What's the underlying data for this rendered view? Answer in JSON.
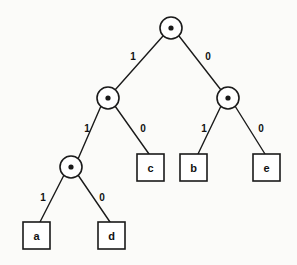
{
  "diagram": {
    "type": "binary-tree",
    "colors": {
      "stroke": "#1a1a1a",
      "background": "#fbfbf9",
      "text": "#111111"
    },
    "internal_nodes": [
      {
        "id": "root",
        "symbol": "•",
        "cx": 171,
        "cy": 28,
        "r": 11,
        "dot_r": 2.6
      },
      {
        "id": "n-l",
        "symbol": "•",
        "cx": 108,
        "cy": 98,
        "r": 11,
        "dot_r": 2.6
      },
      {
        "id": "n-r",
        "symbol": "•",
        "cx": 228,
        "cy": 98,
        "r": 11,
        "dot_r": 2.6
      },
      {
        "id": "n-ll",
        "symbol": "•",
        "cx": 71,
        "cy": 167,
        "r": 11,
        "dot_r": 2.6
      }
    ],
    "leaves": [
      {
        "id": "leaf-c",
        "label": "c",
        "x": 137,
        "y": 154,
        "w": 27,
        "h": 27
      },
      {
        "id": "leaf-b",
        "label": "b",
        "x": 180,
        "y": 154,
        "w": 27,
        "h": 27
      },
      {
        "id": "leaf-e",
        "label": "e",
        "x": 253,
        "y": 154,
        "w": 27,
        "h": 27
      },
      {
        "id": "leaf-a",
        "label": "a",
        "x": 23,
        "y": 222,
        "w": 27,
        "h": 27
      },
      {
        "id": "leaf-d",
        "label": "d",
        "x": 98,
        "y": 222,
        "w": 27,
        "h": 27
      }
    ],
    "edges": [
      {
        "id": "root-to-left",
        "from": "root",
        "to": "n-l",
        "label": "1",
        "x1": 163,
        "y1": 36,
        "x2": 115,
        "y2": 90,
        "lx": 133,
        "ly": 56
      },
      {
        "id": "root-to-right",
        "from": "root",
        "to": "n-r",
        "label": "0",
        "x1": 179,
        "y1": 36,
        "x2": 221,
        "y2": 90,
        "lx": 208,
        "ly": 56
      },
      {
        "id": "left-to-ll",
        "from": "n-l",
        "to": "n-ll",
        "label": "1",
        "x1": 101,
        "y1": 106,
        "x2": 78,
        "y2": 159,
        "lx": 87,
        "ly": 128
      },
      {
        "id": "left-to-c",
        "from": "n-l",
        "to": "leaf-c",
        "label": "0",
        "x1": 115,
        "y1": 106,
        "x2": 149,
        "y2": 154,
        "lx": 143,
        "ly": 128
      },
      {
        "id": "right-to-b",
        "from": "n-r",
        "to": "leaf-b",
        "label": "1",
        "x1": 221,
        "y1": 106,
        "x2": 198,
        "y2": 154,
        "lx": 204,
        "ly": 128
      },
      {
        "id": "right-to-e",
        "from": "n-r",
        "to": "leaf-e",
        "label": "0",
        "x1": 235,
        "y1": 106,
        "x2": 265,
        "y2": 154,
        "lx": 261,
        "ly": 128
      },
      {
        "id": "ll-to-a",
        "from": "n-ll",
        "to": "leaf-a",
        "label": "1",
        "x1": 64,
        "y1": 175,
        "x2": 40,
        "y2": 222,
        "lx": 43,
        "ly": 197
      },
      {
        "id": "ll-to-d",
        "from": "n-ll",
        "to": "leaf-d",
        "label": "0",
        "x1": 78,
        "y1": 175,
        "x2": 110,
        "y2": 222,
        "lx": 102,
        "ly": 197
      }
    ],
    "codes": [
      {
        "symbol": "a",
        "code": "111"
      },
      {
        "symbol": "d",
        "code": "110"
      },
      {
        "symbol": "c",
        "code": "10"
      },
      {
        "symbol": "b",
        "code": "01"
      },
      {
        "symbol": "e",
        "code": "00"
      }
    ]
  }
}
